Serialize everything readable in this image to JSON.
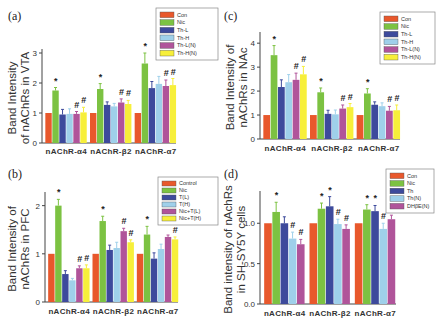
{
  "colors": [
    "#e8582c",
    "#7cc242",
    "#3d4a9c",
    "#9fd0ea",
    "#b0549a",
    "#f7ef3a"
  ],
  "chart_data": [
    {
      "id": "a",
      "panel_label": "(a)",
      "type": "bar",
      "title": "",
      "xlabel": "",
      "ylabel": "Band Intensity of nAChRs in VTA",
      "ylim": [
        0,
        3
      ],
      "yticks": [
        0,
        1,
        2,
        3
      ],
      "categories": [
        "nAChR-α4",
        "nAChR-β2",
        "nAChR-α7"
      ],
      "legend_position": "top-right",
      "series": [
        {
          "name": "Con",
          "values": [
            1.0,
            1.0,
            1.0
          ],
          "errors": [
            0,
            0,
            0
          ],
          "marks": [
            "",
            "",
            ""
          ]
        },
        {
          "name": "Nic",
          "values": [
            1.75,
            1.8,
            2.65
          ],
          "errors": [
            0.1,
            0.18,
            0.35
          ],
          "marks": [
            "*",
            "*",
            "*"
          ]
        },
        {
          "name": "Th-L",
          "values": [
            0.95,
            1.27,
            1.83
          ],
          "errors": [
            0.17,
            0.1,
            0.22
          ],
          "marks": [
            "",
            "",
            ""
          ]
        },
        {
          "name": "Th-H",
          "values": [
            0.97,
            1.22,
            1.97
          ],
          "errors": [
            0.17,
            0.1,
            0.25
          ],
          "marks": [
            "",
            "",
            ""
          ]
        },
        {
          "name": "Th-L(N)",
          "values": [
            0.97,
            1.35,
            1.9
          ],
          "errors": [
            0.08,
            0.12,
            0.2
          ],
          "marks": [
            "#",
            "#",
            "#"
          ]
        },
        {
          "name": "Th-H(N)",
          "values": [
            1.02,
            1.3,
            1.93
          ],
          "errors": [
            0.17,
            0.12,
            0.22
          ],
          "marks": [
            "#",
            "#",
            "#"
          ]
        }
      ]
    },
    {
      "id": "b",
      "panel_label": "(b)",
      "type": "bar",
      "title": "",
      "xlabel": "",
      "ylabel": "Band Intensity of nAChRs in PFC",
      "ylim": [
        0,
        2.2
      ],
      "yticks": [
        0,
        1,
        2
      ],
      "categories": [
        "nAChR-α4",
        "nAChR-β2",
        "nAChR-α7"
      ],
      "legend_position": "top-right",
      "series": [
        {
          "name": "Control",
          "values": [
            1.0,
            1.0,
            1.0
          ],
          "errors": [
            0,
            0,
            0
          ],
          "marks": [
            "",
            "",
            ""
          ]
        },
        {
          "name": "Nic",
          "values": [
            2.0,
            1.68,
            1.4
          ],
          "errors": [
            0.13,
            0.1,
            0.17
          ],
          "marks": [
            "*",
            "*",
            "*"
          ]
        },
        {
          "name": "T(L)",
          "values": [
            0.58,
            1.08,
            0.9
          ],
          "errors": [
            0.07,
            0.1,
            0.12
          ],
          "marks": [
            "",
            "",
            ""
          ]
        },
        {
          "name": "T(H)",
          "values": [
            0.45,
            1.12,
            1.1
          ],
          "errors": [
            0.04,
            0.12,
            0.1
          ],
          "marks": [
            "",
            "",
            ""
          ]
        },
        {
          "name": "Nic+T(L)",
          "values": [
            0.7,
            1.47,
            1.35
          ],
          "errors": [
            0.05,
            0.06,
            0.04
          ],
          "marks": [
            "#",
            "#",
            ""
          ]
        },
        {
          "name": "Nic+T(H)",
          "values": [
            0.7,
            1.24,
            1.3
          ],
          "errors": [
            0.07,
            0.05,
            0.05
          ],
          "marks": [
            "#",
            "#",
            "#"
          ]
        }
      ]
    },
    {
      "id": "c",
      "panel_label": "(c)",
      "type": "bar",
      "title": "",
      "xlabel": "",
      "ylabel": "Band Intensity of nAChRs in NAc",
      "ylim": [
        0,
        4.3
      ],
      "yticks": [
        0,
        1,
        2,
        3,
        4
      ],
      "categories": [
        "nAChR-α4",
        "nAChR-β2",
        "nAChR-α7"
      ],
      "legend_position": "top-right",
      "series": [
        {
          "name": "Con",
          "values": [
            1.0,
            1.0,
            1.0
          ],
          "errors": [
            0,
            0,
            0
          ],
          "marks": [
            "",
            "",
            ""
          ]
        },
        {
          "name": "Nic",
          "values": [
            3.5,
            1.95,
            1.9
          ],
          "errors": [
            0.4,
            0.18,
            0.2
          ],
          "marks": [
            "*",
            "*",
            "*"
          ]
        },
        {
          "name": "Th-L",
          "values": [
            2.17,
            1.05,
            1.43
          ],
          "errors": [
            0.3,
            0.15,
            0.12
          ],
          "marks": [
            "",
            "",
            ""
          ]
        },
        {
          "name": "Th-H",
          "values": [
            2.37,
            1.03,
            1.37
          ],
          "errors": [
            0.32,
            0.18,
            0.14
          ],
          "marks": [
            "",
            "",
            ""
          ]
        },
        {
          "name": "Th-L(N)",
          "values": [
            2.47,
            1.27,
            1.18
          ],
          "errors": [
            0.28,
            0.15,
            0.18
          ],
          "marks": [
            "#",
            "#",
            "#"
          ]
        },
        {
          "name": "Th-H(N)",
          "values": [
            2.7,
            1.33,
            1.2
          ],
          "errors": [
            0.33,
            0.15,
            0.22
          ],
          "marks": [
            "#",
            "#",
            "#"
          ]
        }
      ]
    },
    {
      "id": "d",
      "panel_label": "(d)",
      "type": "bar",
      "title": "",
      "xlabel": "",
      "ylabel": "Band intensity of nAchRs in SH-SY5Y cells",
      "ylim": [
        0,
        1.35
      ],
      "yticks": [
        0.0,
        0.5,
        1.0
      ],
      "ytick_labels": [
        "0.0",
        "0.5",
        "1.0"
      ],
      "categories": [
        "nAChR-α4",
        "nAChR-β2",
        "nAChR-α7"
      ],
      "legend_position": "top-right",
      "series": [
        {
          "name": "Con",
          "values": [
            1.0,
            1.0,
            1.0
          ],
          "errors": [
            0,
            0,
            0
          ],
          "marks": [
            "",
            "",
            ""
          ]
        },
        {
          "name": "Nic",
          "values": [
            1.14,
            1.18,
            1.17
          ],
          "errors": [
            0.12,
            0.07,
            0.06
          ],
          "marks": [
            "*",
            "*",
            "*"
          ]
        },
        {
          "name": "Th",
          "values": [
            1.0,
            1.21,
            1.15
          ],
          "errors": [
            0.08,
            0.12,
            0.07
          ],
          "marks": [
            "",
            "*",
            "*"
          ]
        },
        {
          "name": "Th(N)",
          "values": [
            0.81,
            0.99,
            0.93
          ],
          "errors": [
            0.08,
            0.06,
            0.07
          ],
          "marks": [
            "#",
            "#",
            "#"
          ]
        },
        {
          "name": "DHβE(N)",
          "values": [
            0.74,
            0.93,
            1.05
          ],
          "errors": [
            0.06,
            0.05,
            0.05
          ],
          "marks": [
            "#",
            "#",
            "#"
          ]
        }
      ]
    }
  ]
}
